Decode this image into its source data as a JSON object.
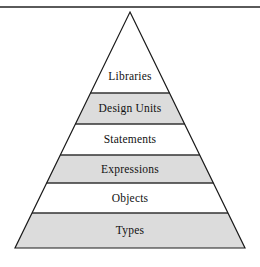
{
  "figure": {
    "type": "pyramid-hierarchy-diagram",
    "background_color": "#ffffff",
    "top_rule": {
      "name": "horizontal-rule",
      "color": "#5a5a5a",
      "y": 6,
      "thickness": 2,
      "width": 260
    },
    "pyramid": {
      "apex_x": 130,
      "apex_y": 12,
      "base_y": 248,
      "base_left_x": 15,
      "base_right_x": 245,
      "outline_color": "#1a1a1a",
      "outline_width": 1.2,
      "divider_color": "#333333",
      "fill_shaded": "#dcdcdc",
      "fill_plain": "#ffffff",
      "divider_y": [
        93,
        124,
        155,
        183,
        213
      ],
      "bands": [
        {
          "label": "Libraries",
          "shaded": false,
          "top_y": 12,
          "bottom_y": 93,
          "label_y": 71
        },
        {
          "label": "Design Units",
          "shaded": true,
          "top_y": 93,
          "bottom_y": 124,
          "label_y": 103
        },
        {
          "label": "Statements",
          "shaded": false,
          "top_y": 124,
          "bottom_y": 155,
          "label_y": 134
        },
        {
          "label": "Expressions",
          "shaded": true,
          "top_y": 155,
          "bottom_y": 183,
          "label_y": 164
        },
        {
          "label": "Objects",
          "shaded": false,
          "top_y": 183,
          "bottom_y": 213,
          "label_y": 193
        },
        {
          "label": "Types",
          "shaded": true,
          "top_y": 213,
          "bottom_y": 248,
          "label_y": 225
        }
      ]
    }
  }
}
